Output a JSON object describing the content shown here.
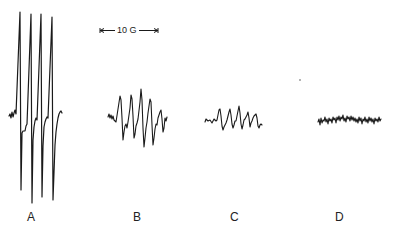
{
  "figure": {
    "type": "EPR spectra panel",
    "scale_bar": {
      "label": "10 G"
    },
    "panels": [
      {
        "id": "A",
        "label": "A",
        "description": "strong four-line spectrum"
      },
      {
        "id": "B",
        "label": "B",
        "description": "weaker multi-line spectrum"
      },
      {
        "id": "C",
        "label": "C",
        "description": "weak multi-line spectrum"
      },
      {
        "id": "D",
        "label": "D",
        "description": "noise, no signal"
      }
    ]
  },
  "colors": {
    "ink": "#1a1a1a",
    "background": "#ffffff"
  }
}
